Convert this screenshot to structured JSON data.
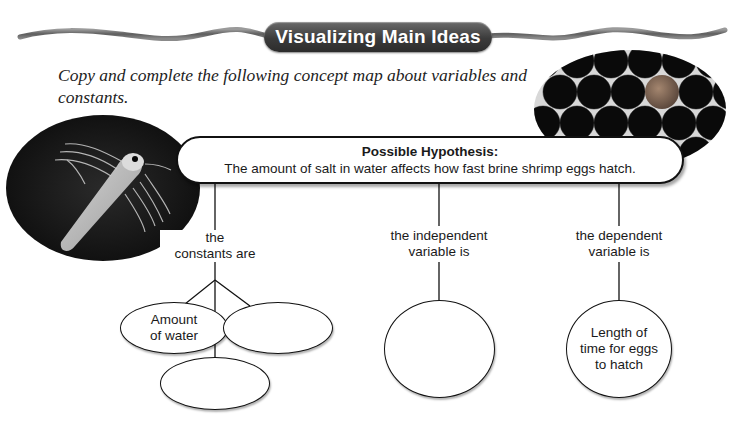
{
  "banner": {
    "title": "Visualizing Main Ideas"
  },
  "instruction": "Copy and complete the following concept map about variables and constants.",
  "images": {
    "left_photo": "brine-shrimp-photo",
    "right_photo": "brine-shrimp-eggs-photo"
  },
  "concept_map": {
    "hypothesis": {
      "title": "Possible Hypothesis:",
      "text": "The amount of salt in water affects how fast brine shrimp eggs hatch."
    },
    "branches": [
      {
        "label_line1": "the",
        "label_line2": "constants are",
        "nodes": [
          {
            "text_line1": "Amount",
            "text_line2": "of water"
          },
          {
            "text_line1": "",
            "text_line2": ""
          },
          {
            "text_line1": "",
            "text_line2": ""
          }
        ]
      },
      {
        "label_line1": "the independent",
        "label_line2": "variable is",
        "nodes": [
          {
            "text_line1": "",
            "text_line2": ""
          }
        ]
      },
      {
        "label_line1": "the dependent",
        "label_line2": "variable is",
        "nodes": [
          {
            "text_line1": "Length of",
            "text_line2": "time for eggs",
            "text_line3": "to hatch"
          }
        ]
      }
    ]
  },
  "colors": {
    "banner_bg": "#3b3b3b",
    "wave": "#6e6e6e",
    "photo_bg": "#141414",
    "egg_highlight": "#8a6a55"
  }
}
